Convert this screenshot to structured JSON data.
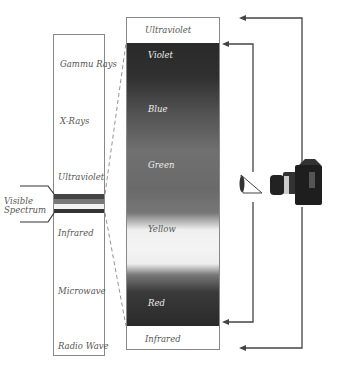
{
  "spectrum": {
    "bands": [
      {
        "label": "Gammu Rays"
      },
      {
        "label": "X-Rays"
      },
      {
        "label": "Ultraviolet"
      },
      {
        "label": "Infrared"
      },
      {
        "label": "Microwave"
      },
      {
        "label": "Radio Wave"
      }
    ],
    "visible_label_line1": "Visible",
    "visible_label_line2": "Spectrum"
  },
  "detail": {
    "top_label": "Ultraviolet",
    "bottom_label": "Infrared",
    "colors": [
      {
        "label": "Violet"
      },
      {
        "label": "Blue"
      },
      {
        "label": "Green"
      },
      {
        "label": "Yellow"
      },
      {
        "label": "Red"
      }
    ]
  },
  "icons": {
    "eye": "eye-icon",
    "camera": "camera-icon"
  },
  "colors": {
    "line": "#444444",
    "box_border": "#888888",
    "dark_band": "#2a2a2a"
  }
}
